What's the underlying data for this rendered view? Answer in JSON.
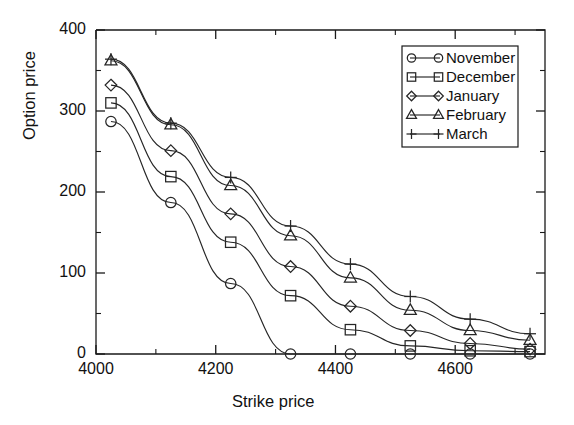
{
  "chart_data": {
    "type": "line",
    "title": "",
    "xlabel": "Strike price",
    "ylabel": "Option price",
    "xlim": [
      4000,
      4750
    ],
    "ylim": [
      0,
      400
    ],
    "xticks": [
      4000,
      4200,
      4400,
      4600
    ],
    "yticks": [
      0,
      100,
      200,
      300,
      400
    ],
    "xticklabels": [
      "4000",
      "4200",
      "4400",
      "4600"
    ],
    "yticklabels": [
      "0",
      "100",
      "200",
      "300",
      "400"
    ],
    "x_minor_ticks": [
      4100,
      4300,
      4500,
      4700
    ],
    "y_minor_ticks": [
      50,
      150,
      250,
      350
    ],
    "grid": false,
    "legend_position": "upper right",
    "x": [
      4025,
      4125,
      4225,
      4325,
      4425,
      4525,
      4625,
      4725
    ],
    "series": [
      {
        "name": "November",
        "marker": "circle",
        "values": [
          287,
          187,
          87,
          0,
          0,
          0,
          0,
          0
        ]
      },
      {
        "name": "December",
        "marker": "square",
        "values": [
          310,
          219,
          138,
          72,
          30,
          10,
          4,
          3
        ]
      },
      {
        "name": "January",
        "marker": "diamond",
        "values": [
          332,
          251,
          173,
          108,
          59,
          29,
          13,
          6
        ]
      },
      {
        "name": "February",
        "marker": "triangle",
        "values": [
          362,
          283,
          208,
          146,
          94,
          54,
          29,
          17
        ]
      },
      {
        "name": "March",
        "marker": "plus",
        "values": [
          364,
          285,
          218,
          158,
          111,
          71,
          43,
          25
        ]
      }
    ]
  },
  "legend": {
    "entries": [
      {
        "label": "November",
        "marker": "circle"
      },
      {
        "label": "December",
        "marker": "square"
      },
      {
        "label": "January",
        "marker": "diamond"
      },
      {
        "label": "February",
        "marker": "triangle"
      },
      {
        "label": "March",
        "marker": "plus"
      }
    ]
  },
  "style": {
    "line_color": "#262626",
    "axis_color": "#1a1a1a",
    "background": "#ffffff"
  }
}
